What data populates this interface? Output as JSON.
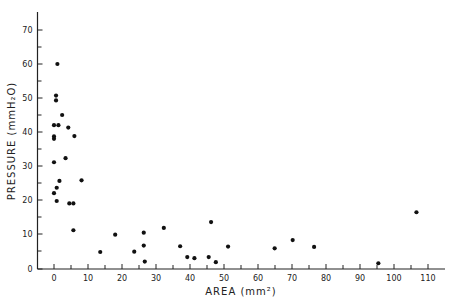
{
  "chart_data": {
    "type": "scatter",
    "title": "",
    "xlabel": "AREA (mm²)",
    "ylabel": "PRESSURE (mmH₂O)",
    "xlim": [
      -4.5,
      115
    ],
    "ylim": [
      0,
      75
    ],
    "grid": false,
    "legend": null,
    "x_major_ticks": [
      0,
      10,
      20,
      30,
      40,
      50,
      60,
      70,
      80,
      90,
      100,
      110
    ],
    "x_minor_ticks": [
      5,
      15,
      25,
      35,
      45,
      55,
      65,
      75,
      85,
      95,
      105
    ],
    "y_major_ticks": [
      0,
      10,
      20,
      30,
      40,
      50,
      60,
      70
    ],
    "y_minor_ticks": [
      5,
      15,
      25,
      35,
      45,
      55,
      65
    ],
    "x_tick_labels": [
      "0",
      "10",
      "20",
      "30",
      "40",
      "50",
      "60",
      "70",
      "80",
      "90",
      "100",
      "110"
    ],
    "y_tick_labels": [
      "0",
      "10",
      "20",
      "30",
      "40",
      "50",
      "60",
      "70"
    ],
    "points": [
      {
        "x": 1.0,
        "y": 60.0
      },
      {
        "x": 0.6,
        "y": 50.7
      },
      {
        "x": 0.6,
        "y": 49.3
      },
      {
        "x": 2.4,
        "y": 45.0
      },
      {
        "x": 0.0,
        "y": 42.0
      },
      {
        "x": 1.3,
        "y": 42.0
      },
      {
        "x": 4.2,
        "y": 41.3
      },
      {
        "x": 6.0,
        "y": 38.8
      },
      {
        "x": 0.0,
        "y": 38.7
      },
      {
        "x": 0.0,
        "y": 38.0
      },
      {
        "x": 3.4,
        "y": 32.3
      },
      {
        "x": 0.0,
        "y": 31.1
      },
      {
        "x": 1.6,
        "y": 25.6
      },
      {
        "x": 8.1,
        "y": 25.8
      },
      {
        "x": 0.8,
        "y": 23.6
      },
      {
        "x": 0.0,
        "y": 22.0
      },
      {
        "x": 0.8,
        "y": 19.7
      },
      {
        "x": 4.5,
        "y": 19.0
      },
      {
        "x": 5.7,
        "y": 19.0
      },
      {
        "x": 5.7,
        "y": 11.1
      },
      {
        "x": 18.0,
        "y": 9.8
      },
      {
        "x": 13.6,
        "y": 4.7
      },
      {
        "x": 26.4,
        "y": 10.4
      },
      {
        "x": 32.3,
        "y": 11.8
      },
      {
        "x": 46.2,
        "y": 13.5
      },
      {
        "x": 26.4,
        "y": 6.6
      },
      {
        "x": 23.6,
        "y": 4.8
      },
      {
        "x": 26.7,
        "y": 1.9
      },
      {
        "x": 37.1,
        "y": 6.4
      },
      {
        "x": 39.2,
        "y": 3.2
      },
      {
        "x": 41.3,
        "y": 2.9
      },
      {
        "x": 45.5,
        "y": 3.2
      },
      {
        "x": 47.6,
        "y": 1.7
      },
      {
        "x": 51.2,
        "y": 6.3
      },
      {
        "x": 64.9,
        "y": 5.8
      },
      {
        "x": 70.2,
        "y": 8.2
      },
      {
        "x": 76.5,
        "y": 6.2
      },
      {
        "x": 95.4,
        "y": 1.4
      },
      {
        "x": 106.6,
        "y": 16.4
      }
    ]
  },
  "style": {
    "ink": "#111111",
    "background": "#ffffff"
  }
}
